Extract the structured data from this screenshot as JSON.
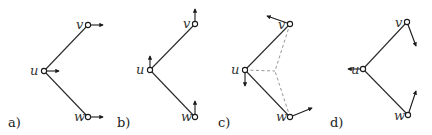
{
  "figure": {
    "panels": [
      {
        "label": "a)",
        "label_pos": [
          8,
          127
        ],
        "nodes": {
          "u": {
            "name": "u",
            "x": 44,
            "y": 71,
            "label_dx": -14,
            "label_dy": 4
          },
          "v": {
            "name": "v",
            "x": 88,
            "y": 25,
            "label_dx": -12,
            "label_dy": 4
          },
          "w": {
            "name": "w",
            "x": 88,
            "y": 117,
            "label_dx": -14,
            "label_dy": 4
          }
        },
        "edges": [
          [
            "u",
            "v"
          ],
          [
            "u",
            "w"
          ]
        ],
        "dashed": [],
        "vectors": {
          "u": [
            59,
            71
          ],
          "v": [
            103,
            25
          ],
          "w": [
            103,
            117
          ]
        }
      },
      {
        "label": "b)",
        "label_pos": [
          117,
          127
        ],
        "nodes": {
          "u": {
            "name": "u",
            "x": 150,
            "y": 70,
            "label_dx": -14,
            "label_dy": 4
          },
          "v": {
            "name": "v",
            "x": 195,
            "y": 24,
            "label_dx": -12,
            "label_dy": 4
          },
          "w": {
            "name": "w",
            "x": 195,
            "y": 117,
            "label_dx": -14,
            "label_dy": 4
          }
        },
        "edges": [
          [
            "u",
            "v"
          ],
          [
            "u",
            "w"
          ]
        ],
        "dashed": [],
        "vectors": {
          "u": [
            150,
            56
          ],
          "v": [
            195,
            9
          ],
          "w": [
            195,
            101
          ]
        }
      },
      {
        "label": "c)",
        "label_pos": [
          218,
          127
        ],
        "nodes": {
          "u": {
            "name": "u",
            "x": 245,
            "y": 70,
            "label_dx": -14,
            "label_dy": 4
          },
          "v": {
            "name": "v",
            "x": 290,
            "y": 24,
            "label_dx": -12,
            "label_dy": 5
          },
          "w": {
            "name": "w",
            "x": 290,
            "y": 117,
            "label_dx": -14,
            "label_dy": 4
          }
        },
        "center": {
          "x": 275,
          "y": 71
        },
        "edges": [
          [
            "u",
            "v"
          ],
          [
            "u",
            "w"
          ]
        ],
        "dashed": [
          [
            "u",
            "center"
          ],
          [
            "v",
            "center"
          ],
          [
            "w",
            "center"
          ]
        ],
        "vectors": {
          "u": [
            245,
            86
          ],
          "v": [
            267,
            16
          ],
          "w": [
            312,
            108
          ]
        }
      },
      {
        "label": "d)",
        "label_pos": [
          330,
          127
        ],
        "nodes": {
          "u": {
            "name": "u",
            "x": 363,
            "y": 69,
            "label_dx": -12,
            "label_dy": 5
          },
          "v": {
            "name": "v",
            "x": 407,
            "y": 22,
            "label_dx": -12,
            "label_dy": 5
          },
          "w": {
            "name": "w",
            "x": 408,
            "y": 115,
            "label_dx": -14,
            "label_dy": 5
          }
        },
        "edges": [
          [
            "u",
            "v"
          ],
          [
            "u",
            "w"
          ]
        ],
        "dashed": [],
        "vectors": {
          "u": [
            348,
            69
          ],
          "v": [
            416,
            46
          ],
          "w": [
            416,
            91
          ]
        }
      }
    ]
  }
}
